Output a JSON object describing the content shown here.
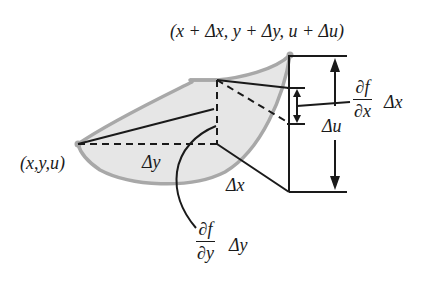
{
  "diagram": {
    "colors": {
      "surface_fill": "#e6e6e6",
      "surface_edge": "#a8a8a8",
      "line": "#1a1a1a",
      "background": "#ffffff"
    },
    "points": {
      "start": {
        "label": "(x,y,u)",
        "x": 78,
        "y": 144
      },
      "end": {
        "label": "(x + Δx, y + Δy, u + Δu)",
        "x": 290,
        "y": 55
      }
    },
    "labels": {
      "top_point": "(x + Δx, y + Δy, u + Δu)",
      "left_point": "(x,y,u)",
      "delta_y": "Δy",
      "delta_x": "Δx",
      "delta_u": "Δu",
      "partial_x": {
        "numerator": "∂f",
        "denominator": "∂x",
        "suffix": "Δx"
      },
      "partial_y": {
        "numerator": "∂f",
        "denominator": "∂y",
        "suffix": "Δy"
      }
    }
  }
}
